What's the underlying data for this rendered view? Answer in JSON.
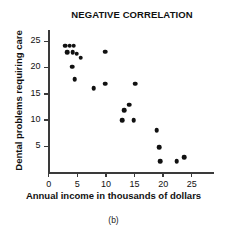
{
  "chart_data": {
    "type": "scatter",
    "title": "NEGATIVE CORRELATION",
    "xlabel": "Annual income in thousands of dollars",
    "ylabel": "Dental problems requiring care",
    "caption": "(b)",
    "xlim": [
      0,
      29
    ],
    "ylim": [
      0,
      27
    ],
    "xticks": [
      0,
      5,
      10,
      15,
      20,
      25
    ],
    "yticks": [
      5,
      10,
      15,
      20,
      25
    ],
    "xtick_labels": [
      "0",
      "5",
      "10",
      "15",
      "20",
      "25"
    ],
    "ytick_labels": [
      "5",
      "10",
      "15",
      "20",
      "25"
    ],
    "grid": false,
    "legend": false,
    "marker": "filled-circle",
    "marker_color": "#111111",
    "axis_color": "#3a3a3a",
    "background": "#ffffff",
    "points": [
      {
        "x": 3.0,
        "y": 24.0
      },
      {
        "x": 3.8,
        "y": 24.0
      },
      {
        "x": 4.5,
        "y": 24.0
      },
      {
        "x": 3.4,
        "y": 22.8
      },
      {
        "x": 4.3,
        "y": 22.8
      },
      {
        "x": 5.0,
        "y": 22.5
      },
      {
        "x": 5.7,
        "y": 21.7
      },
      {
        "x": 4.2,
        "y": 20.0
      },
      {
        "x": 4.7,
        "y": 17.7
      },
      {
        "x": 8.0,
        "y": 15.9
      },
      {
        "x": 10.0,
        "y": 22.9
      },
      {
        "x": 10.0,
        "y": 16.8
      },
      {
        "x": 13.3,
        "y": 11.7
      },
      {
        "x": 14.2,
        "y": 12.8
      },
      {
        "x": 13.0,
        "y": 9.8
      },
      {
        "x": 15.0,
        "y": 9.8
      },
      {
        "x": 15.2,
        "y": 16.8
      },
      {
        "x": 19.0,
        "y": 7.9
      },
      {
        "x": 19.4,
        "y": 4.7
      },
      {
        "x": 19.6,
        "y": 2.0
      },
      {
        "x": 22.5,
        "y": 2.0
      },
      {
        "x": 23.8,
        "y": 2.8
      }
    ]
  }
}
